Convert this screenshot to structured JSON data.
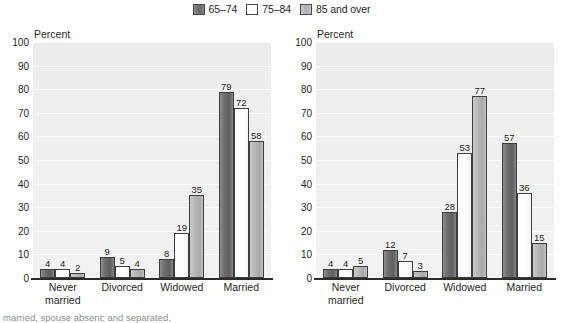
{
  "legend": {
    "items": [
      {
        "label": "65–74",
        "color": "#6f6f6f",
        "swatch": "legend-swatch-65-74"
      },
      {
        "label": "75–84",
        "color": "#ffffff",
        "swatch": "legend-swatch-75-84"
      },
      {
        "label": "85 and over",
        "color": "#b6b6b6",
        "swatch": "legend-swatch-85-over"
      }
    ]
  },
  "axis": {
    "percent_label": "Percent",
    "ticks": [
      "100",
      "90",
      "80",
      "70",
      "60",
      "50",
      "40",
      "30",
      "20",
      "10",
      "0"
    ]
  },
  "panels": {
    "men": {
      "title": "Men"
    },
    "women": {
      "title": "Women"
    }
  },
  "footnote": "married, spouse absent; and separated.",
  "chart_data": [
    {
      "type": "bar",
      "title": "Men",
      "xlabel": "",
      "ylabel": "Percent",
      "ylim": [
        0,
        100
      ],
      "ytick_step": 10,
      "grid": true,
      "legend_position": "top-center",
      "categories": [
        "Never married",
        "Divorced",
        "Widowed",
        "Married"
      ],
      "series": [
        {
          "name": "65–74",
          "values": [
            4,
            9,
            8,
            79
          ]
        },
        {
          "name": "75–84",
          "values": [
            4,
            5,
            19,
            72
          ]
        },
        {
          "name": "85 and over",
          "values": [
            2,
            4,
            35,
            58
          ]
        }
      ]
    },
    {
      "type": "bar",
      "title": "Women",
      "xlabel": "",
      "ylabel": "Percent",
      "ylim": [
        0,
        100
      ],
      "ytick_step": 10,
      "grid": true,
      "legend_position": "top-center",
      "categories": [
        "Never married",
        "Divorced",
        "Widowed",
        "Married"
      ],
      "series": [
        {
          "name": "65–74",
          "values": [
            4,
            12,
            28,
            57
          ]
        },
        {
          "name": "75–84",
          "values": [
            4,
            7,
            53,
            36
          ]
        },
        {
          "name": "85 and over",
          "values": [
            5,
            3,
            77,
            15
          ]
        }
      ]
    }
  ]
}
